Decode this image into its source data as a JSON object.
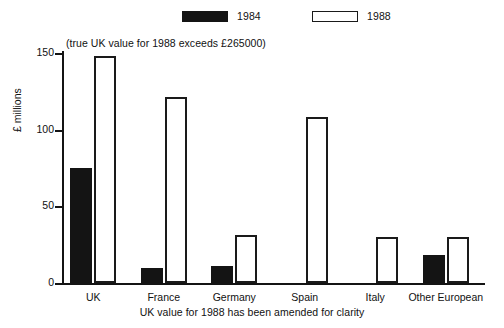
{
  "chart_data": {
    "type": "bar",
    "title": "",
    "subtitle": "",
    "xlabel": "",
    "ylabel": "£ millions",
    "ylim": [
      0,
      150
    ],
    "yticks": [
      0,
      50,
      100,
      150
    ],
    "ytick_labels": [
      "0",
      "50",
      "100",
      "150"
    ],
    "grid": false,
    "legend_position": "top",
    "categories": [
      "UK",
      "France",
      "Germany",
      "Spain",
      "Italy",
      "Other European"
    ],
    "series": [
      {
        "name": "1984",
        "swatch": "filled",
        "color": "#141414",
        "values": [
          75,
          10,
          11,
          0,
          0,
          18
        ]
      },
      {
        "name": "1988",
        "swatch": "hollow",
        "color": "#ffffff",
        "values": [
          148,
          121,
          31,
          108,
          30,
          30
        ]
      }
    ],
    "annotations": [
      {
        "name": "uk-true-value-note",
        "text": "(true UK value for 1988 exceeds £265000)"
      }
    ],
    "caption": "UK value for 1988 has been amended for clarity"
  },
  "legend": {
    "entries": [
      {
        "label": "1984"
      },
      {
        "label": "1988"
      }
    ]
  },
  "colors": {
    "ink": "#141414",
    "background": "#ffffff"
  }
}
